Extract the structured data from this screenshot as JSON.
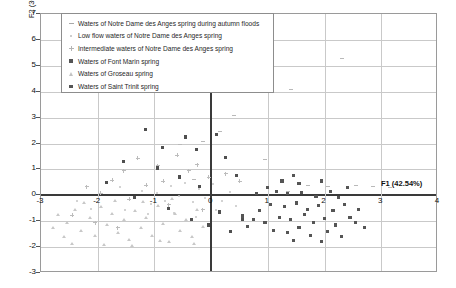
{
  "chart_data": {
    "type": "scatter",
    "title": "",
    "xlabel": "F1 (42.54%)",
    "ylabel": "F2 (30.91%)",
    "xlim": [
      -3,
      4
    ],
    "ylim": [
      -3,
      7
    ],
    "xticks": [
      -3,
      -2,
      -1,
      0,
      1,
      2,
      3,
      4
    ],
    "yticks": [
      -3,
      -2,
      -1,
      0,
      1,
      2,
      3,
      4,
      5,
      6,
      7
    ],
    "grid": true,
    "legend_position": "top-left",
    "series": [
      {
        "name": "Waters of Notre Dame des Anges spring during autumn floods",
        "marker": "dash",
        "color": "#b9b9b9",
        "points": [
          [
            2.3,
            5.25
          ],
          [
            1.05,
            4.1
          ],
          [
            1.4,
            4.05
          ],
          [
            0.55,
            4.45
          ],
          [
            0.4,
            3.05
          ],
          [
            -0.15,
            2.05
          ],
          [
            0.95,
            1.35
          ],
          [
            -0.55,
            1.9
          ],
          [
            0.15,
            2.4
          ],
          [
            1.7,
            0.35
          ],
          [
            -0.3,
            0.55
          ],
          [
            2.05,
            0.3
          ],
          [
            2.55,
            0.35
          ],
          [
            2.85,
            0.3
          ],
          [
            1.35,
            0.1
          ],
          [
            3.15,
            0.25
          ]
        ]
      },
      {
        "name": "Low flow waters of Notre Dame des Anges spring",
        "marker": "dot",
        "color": "#c4c4c4",
        "points": [
          [
            -1.85,
            0.45
          ],
          [
            -1.6,
            0.3
          ],
          [
            -1.35,
            -0.1
          ],
          [
            -1.2,
            0.15
          ],
          [
            -1.05,
            -0.35
          ],
          [
            -0.95,
            0.05
          ],
          [
            -0.8,
            -0.25
          ],
          [
            -0.7,
            0.35
          ],
          [
            -0.55,
            -0.05
          ],
          [
            -0.45,
            0.45
          ],
          [
            -0.3,
            -0.3
          ],
          [
            -0.2,
            0.2
          ],
          [
            -0.1,
            -0.15
          ],
          [
            0.05,
            0.4
          ],
          [
            0.2,
            -0.25
          ],
          [
            0.35,
            0.1
          ],
          [
            -2.1,
            -0.55
          ],
          [
            -2.35,
            -0.25
          ],
          [
            -1.5,
            -0.6
          ],
          [
            -1.1,
            -0.75
          ],
          [
            -0.65,
            -0.7
          ],
          [
            -0.25,
            -0.85
          ],
          [
            0.1,
            -0.6
          ],
          [
            0.45,
            -0.45
          ]
        ]
      },
      {
        "name": "Intermediate waters of Notre Dame des Anges spring",
        "marker": "plus",
        "color": "#bcbcbc",
        "points": [
          [
            -1.3,
            1.45
          ],
          [
            -1.55,
            0.95
          ],
          [
            -0.95,
            1.15
          ],
          [
            -1.75,
            0.6
          ],
          [
            -0.6,
            1.55
          ],
          [
            -0.4,
            0.95
          ],
          [
            -1.15,
            0.4
          ],
          [
            -0.85,
            0.55
          ],
          [
            -0.25,
            1.2
          ],
          [
            -0.05,
            0.7
          ],
          [
            -1.95,
            0.1
          ],
          [
            -2.2,
            0.35
          ],
          [
            -1.45,
            -0.15
          ],
          [
            -0.75,
            -0.35
          ],
          [
            -0.15,
            -0.55
          ],
          [
            0.25,
            0.85
          ],
          [
            0.5,
            0.55
          ],
          [
            -2.45,
            -0.75
          ],
          [
            -2.05,
            -1.05
          ],
          [
            -1.65,
            -1.25
          ]
        ]
      },
      {
        "name": "Waters of Font Marin spring",
        "marker": "square-dark",
        "color": "#4f4f4f",
        "points": [
          [
            -1.15,
            2.55
          ],
          [
            -0.85,
            1.85
          ],
          [
            -0.45,
            2.25
          ],
          [
            -0.25,
            1.75
          ],
          [
            0.1,
            2.35
          ],
          [
            -1.55,
            1.3
          ],
          [
            -0.95,
            1.05
          ],
          [
            -0.55,
            0.7
          ],
          [
            -1.85,
            0.5
          ],
          [
            -0.2,
            0.35
          ],
          [
            0.25,
            1.45
          ],
          [
            0.45,
            0.75
          ],
          [
            -1.35,
            -0.1
          ],
          [
            -0.75,
            -0.5
          ],
          [
            -0.35,
            -0.95
          ],
          [
            0.15,
            -0.65
          ],
          [
            0.55,
            -0.95
          ],
          [
            -0.05,
            -1.15
          ],
          [
            0.35,
            -1.4
          ]
        ]
      },
      {
        "name": "Waters of Groseau spring",
        "marker": "triangle",
        "color": "#c8c8c8",
        "points": [
          [
            -2.7,
            -0.75
          ],
          [
            -2.55,
            -1.05
          ],
          [
            -2.4,
            -0.55
          ],
          [
            -2.3,
            -1.35
          ],
          [
            -2.15,
            -0.85
          ],
          [
            -2.05,
            -1.55
          ],
          [
            -1.95,
            -0.45
          ],
          [
            -1.85,
            -1.15
          ],
          [
            -1.75,
            -0.7
          ],
          [
            -1.65,
            -1.45
          ],
          [
            -1.55,
            -0.95
          ],
          [
            -1.45,
            -1.7
          ],
          [
            -1.35,
            -0.6
          ],
          [
            -1.25,
            -1.25
          ],
          [
            -1.15,
            -0.85
          ],
          [
            -1.05,
            -1.55
          ],
          [
            -0.95,
            -0.4
          ],
          [
            -0.85,
            -1.1
          ],
          [
            -0.75,
            -1.8
          ],
          [
            -0.65,
            -0.7
          ],
          [
            -0.55,
            -1.35
          ],
          [
            -0.45,
            -0.95
          ],
          [
            -0.35,
            -1.6
          ],
          [
            -0.25,
            -0.55
          ],
          [
            -0.15,
            -1.2
          ],
          [
            -1.9,
            -1.9
          ],
          [
            -1.4,
            -1.95
          ],
          [
            -0.9,
            -1.75
          ],
          [
            -2.45,
            -1.85
          ],
          [
            -2.25,
            -0.3
          ],
          [
            -1.7,
            -0.2
          ],
          [
            -1.2,
            -0.25
          ],
          [
            -0.7,
            -0.15
          ],
          [
            -0.3,
            -1.85
          ],
          [
            -2.6,
            -1.6
          ],
          [
            -2.8,
            -1.25
          ]
        ]
      },
      {
        "name": "Waters of Saint Trinit spring",
        "marker": "square",
        "color": "#555555",
        "points": [
          [
            1.25,
            0.55
          ],
          [
            1.55,
            0.45
          ],
          [
            1.45,
            0.75
          ],
          [
            1.95,
            0.55
          ],
          [
            1.15,
            0.15
          ],
          [
            1.35,
            0.05
          ],
          [
            1.6,
            0.1
          ],
          [
            1.85,
            -0.05
          ],
          [
            2.1,
            0.15
          ],
          [
            2.25,
            -0.1
          ],
          [
            1.05,
            -0.35
          ],
          [
            1.3,
            -0.45
          ],
          [
            1.5,
            -0.3
          ],
          [
            1.7,
            -0.55
          ],
          [
            1.9,
            -0.4
          ],
          [
            2.15,
            -0.6
          ],
          [
            2.35,
            -0.35
          ],
          [
            1.2,
            -0.85
          ],
          [
            1.4,
            -0.95
          ],
          [
            1.65,
            -0.75
          ],
          [
            1.8,
            -1.05
          ],
          [
            2.0,
            -0.9
          ],
          [
            2.2,
            -1.15
          ],
          [
            2.45,
            -0.85
          ],
          [
            0.85,
            -0.6
          ],
          [
            0.95,
            -1.05
          ],
          [
            0.75,
            -0.95
          ],
          [
            1.1,
            -1.35
          ],
          [
            1.35,
            -1.45
          ],
          [
            1.55,
            -1.25
          ],
          [
            1.75,
            -1.55
          ],
          [
            2.05,
            -1.4
          ],
          [
            2.3,
            -1.6
          ],
          [
            0.65,
            -1.2
          ],
          [
            2.55,
            -1.05
          ],
          [
            2.6,
            -0.55
          ],
          [
            1.0,
            0.3
          ],
          [
            2.4,
            0.3
          ],
          [
            0.8,
            0.05
          ],
          [
            1.45,
            -1.75
          ],
          [
            1.95,
            -1.8
          ],
          [
            0.55,
            -0.8
          ],
          [
            2.7,
            -1.25
          ]
        ]
      }
    ]
  },
  "legend": {
    "items": [
      {
        "label": "Waters of Notre Dame des Anges spring during autumn floods",
        "symbol": "dash-marker"
      },
      {
        "label": "Low flow waters of Notre Dame des Anges spring",
        "symbol": "dot-marker"
      },
      {
        "label": "Intermediate waters of Notre Dame des Anges spring",
        "symbol": "plus-marker"
      },
      {
        "label": "Waters of Font Marin spring",
        "symbol": "square-dark-marker"
      },
      {
        "label": "Waters of Groseau spring",
        "symbol": "triangle-marker"
      },
      {
        "label": "Waters of Saint Trinit spring",
        "symbol": "square-marker"
      }
    ]
  }
}
